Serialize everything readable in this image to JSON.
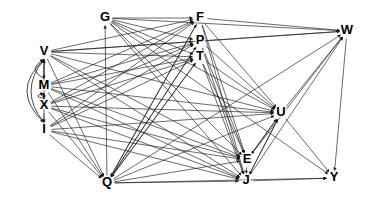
{
  "figure": {
    "kind": "directed-graph",
    "width": 368,
    "height": 206,
    "background_color": "#ffffff",
    "edge_color": "#1a1a1a",
    "node_text_color": "#000000"
  },
  "chart_data": {
    "type": "diagram",
    "subtype": "directed-graph",
    "title": "",
    "directed": true,
    "node_count": 13,
    "edge_count": 96,
    "nodes": [
      {
        "id": "G",
        "label": "G",
        "x": 105,
        "y": 18
      },
      {
        "id": "F",
        "label": "F",
        "x": 200,
        "y": 18
      },
      {
        "id": "W",
        "label": "W",
        "x": 347,
        "y": 31
      },
      {
        "id": "P",
        "label": "P",
        "x": 200,
        "y": 41
      },
      {
        "id": "V",
        "label": "V",
        "x": 44,
        "y": 52
      },
      {
        "id": "T",
        "label": "T",
        "x": 200,
        "y": 57
      },
      {
        "id": "M",
        "label": "M",
        "x": 44,
        "y": 86
      },
      {
        "id": "U",
        "label": "U",
        "x": 281,
        "y": 113
      },
      {
        "id": "X",
        "label": "X",
        "x": 44,
        "y": 106
      },
      {
        "id": "I",
        "label": "I",
        "x": 44,
        "y": 130
      },
      {
        "id": "E",
        "label": "E",
        "x": 247,
        "y": 160
      },
      {
        "id": "Y",
        "label": "Y",
        "x": 334,
        "y": 178
      },
      {
        "id": "J",
        "label": "J",
        "x": 246,
        "y": 181
      },
      {
        "id": "Q",
        "label": "Q",
        "x": 107,
        "y": 183
      }
    ],
    "edges": [
      {
        "from": "G",
        "to": "F"
      },
      {
        "from": "G",
        "to": "P"
      },
      {
        "from": "G",
        "to": "T"
      },
      {
        "from": "G",
        "to": "W"
      },
      {
        "from": "G",
        "to": "U"
      },
      {
        "from": "G",
        "to": "E"
      },
      {
        "from": "G",
        "to": "J"
      },
      {
        "from": "G",
        "to": "Y"
      },
      {
        "from": "V",
        "to": "F"
      },
      {
        "from": "V",
        "to": "P"
      },
      {
        "from": "V",
        "to": "T"
      },
      {
        "from": "V",
        "to": "W"
      },
      {
        "from": "V",
        "to": "U"
      },
      {
        "from": "V",
        "to": "E"
      },
      {
        "from": "V",
        "to": "J"
      },
      {
        "from": "V",
        "to": "Q"
      },
      {
        "from": "V",
        "to": "M"
      },
      {
        "from": "M",
        "to": "F"
      },
      {
        "from": "M",
        "to": "P"
      },
      {
        "from": "M",
        "to": "T"
      },
      {
        "from": "M",
        "to": "U"
      },
      {
        "from": "M",
        "to": "E"
      },
      {
        "from": "M",
        "to": "J"
      },
      {
        "from": "M",
        "to": "Q"
      },
      {
        "from": "M",
        "to": "X"
      },
      {
        "from": "M",
        "to": "V"
      },
      {
        "from": "X",
        "to": "F"
      },
      {
        "from": "X",
        "to": "P"
      },
      {
        "from": "X",
        "to": "T"
      },
      {
        "from": "X",
        "to": "U"
      },
      {
        "from": "X",
        "to": "E"
      },
      {
        "from": "X",
        "to": "J"
      },
      {
        "from": "X",
        "to": "Q"
      },
      {
        "from": "X",
        "to": "I"
      },
      {
        "from": "X",
        "to": "M"
      },
      {
        "from": "I",
        "to": "F"
      },
      {
        "from": "I",
        "to": "P"
      },
      {
        "from": "I",
        "to": "T"
      },
      {
        "from": "I",
        "to": "U"
      },
      {
        "from": "I",
        "to": "E"
      },
      {
        "from": "I",
        "to": "J"
      },
      {
        "from": "I",
        "to": "Q"
      },
      {
        "from": "I",
        "to": "V"
      },
      {
        "from": "Q",
        "to": "G"
      },
      {
        "from": "Q",
        "to": "F"
      },
      {
        "from": "Q",
        "to": "P"
      },
      {
        "from": "Q",
        "to": "T"
      },
      {
        "from": "Q",
        "to": "W"
      },
      {
        "from": "Q",
        "to": "U"
      },
      {
        "from": "Q",
        "to": "E"
      },
      {
        "from": "Q",
        "to": "J"
      },
      {
        "from": "Q",
        "to": "Y"
      },
      {
        "from": "F",
        "to": "W"
      },
      {
        "from": "F",
        "to": "U"
      },
      {
        "from": "F",
        "to": "E"
      },
      {
        "from": "F",
        "to": "J"
      },
      {
        "from": "F",
        "to": "Q"
      },
      {
        "from": "P",
        "to": "W"
      },
      {
        "from": "P",
        "to": "U"
      },
      {
        "from": "P",
        "to": "E"
      },
      {
        "from": "P",
        "to": "J"
      },
      {
        "from": "P",
        "to": "Q"
      },
      {
        "from": "T",
        "to": "U"
      },
      {
        "from": "T",
        "to": "E"
      },
      {
        "from": "T",
        "to": "J"
      },
      {
        "from": "T",
        "to": "Q"
      },
      {
        "from": "U",
        "to": "W"
      },
      {
        "from": "U",
        "to": "E"
      },
      {
        "from": "U",
        "to": "J"
      },
      {
        "from": "U",
        "to": "Y"
      },
      {
        "from": "E",
        "to": "U"
      },
      {
        "from": "E",
        "to": "J"
      },
      {
        "from": "E",
        "to": "W"
      },
      {
        "from": "J",
        "to": "U"
      },
      {
        "from": "J",
        "to": "Y"
      },
      {
        "from": "J",
        "to": "W"
      },
      {
        "from": "W",
        "to": "Y"
      }
    ],
    "curved_edges": [
      {
        "from": "I",
        "to": "V",
        "note": "outer left arc"
      },
      {
        "from": "M",
        "to": "V",
        "note": "inner left arc"
      },
      {
        "from": "X",
        "to": "M",
        "note": "inner left arc"
      },
      {
        "from": "V",
        "to": "I",
        "note": "outer left arc downward"
      }
    ],
    "layout_note": "Nodes arranged with a vertical left column (V, M, X, I), G top-left-center, F/P/T stacked top-center-right, W far right top, U mid-right, E and J bottom-right-center, Y bottom far right, Q bottom-center."
  }
}
